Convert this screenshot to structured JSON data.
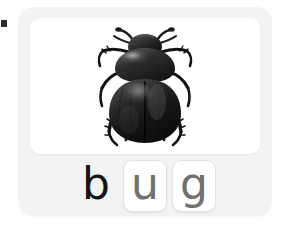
{
  "card": {
    "word": "bug",
    "background_color": "#f3f3f3",
    "panel_color": "#ffffff"
  },
  "picture": {
    "icon_name": "beetle-image",
    "subject": "beetle",
    "alt": "black beetle seen from above"
  },
  "letters": [
    {
      "char": "b",
      "state": "filled",
      "color": "#151515"
    },
    {
      "char": "u",
      "state": "empty",
      "color": "#707070"
    },
    {
      "char": "g",
      "state": "empty",
      "color": "#707070"
    }
  ],
  "edge_marker": {
    "icon_name": "cursor-marker",
    "color": "#2b2b2b"
  }
}
